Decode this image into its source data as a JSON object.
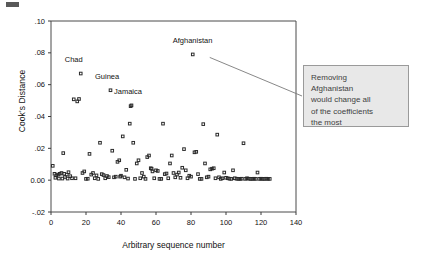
{
  "chart_data": {
    "type": "scatter",
    "title": "",
    "xlabel": "Arbitrary sequence number",
    "ylabel": "Cook's Distance",
    "xlim": [
      0,
      140
    ],
    "ylim": [
      -0.02,
      0.1
    ],
    "xticks": [
      "0",
      "20",
      "40",
      "60",
      "80",
      "100",
      "120",
      "140"
    ],
    "xtick_values": [
      0,
      20,
      40,
      60,
      80,
      100,
      120,
      140
    ],
    "yticks": [
      "-.02",
      "0.00",
      ".02",
      ".04",
      ".06",
      ".08",
      ".10"
    ],
    "ytick_values": [
      -0.02,
      0.0,
      0.02,
      0.04,
      0.06,
      0.08,
      0.1
    ],
    "grid": false,
    "legend": "none",
    "marker": "open-square",
    "marker_color": "#2a2a2a",
    "annotations": [
      {
        "text": "Chad",
        "x": 17,
        "y": 0.067,
        "label_dx": -4,
        "label_dy": 0.006
      },
      {
        "text": "Guinea",
        "x": 34,
        "y": 0.0565,
        "label_dx": -2,
        "label_dy": 0.006
      },
      {
        "text": "Jamaica",
        "x": 46,
        "y": 0.047,
        "label_dx": -2,
        "label_dy": 0.006
      },
      {
        "text": "Afghanistan",
        "x": 81,
        "y": 0.079,
        "label_dx": 0,
        "label_dy": 0.006
      }
    ],
    "points": [
      [
        1,
        0.009
      ],
      [
        2,
        0.004
      ],
      [
        2.5,
        0.0015
      ],
      [
        3,
        0.003
      ],
      [
        4,
        0.0035
      ],
      [
        4.5,
        0.001
      ],
      [
        5,
        0.004
      ],
      [
        6,
        0.0045
      ],
      [
        6.5,
        0.001
      ],
      [
        7,
        0.017
      ],
      [
        7.5,
        0.004
      ],
      [
        8,
        0.002
      ],
      [
        9,
        0.0035
      ],
      [
        9.5,
        0.001
      ],
      [
        10,
        0.005
      ],
      [
        11,
        0.0025
      ],
      [
        12,
        0.0012
      ],
      [
        13,
        0.0508
      ],
      [
        14,
        0.0012
      ],
      [
        15,
        0.0495
      ],
      [
        16,
        0.051
      ],
      [
        17,
        0.067
      ],
      [
        18,
        0.0045
      ],
      [
        19,
        0.0055
      ],
      [
        20,
        0.0008
      ],
      [
        21,
        0.0009
      ],
      [
        22,
        0.0165
      ],
      [
        23,
        0.0035
      ],
      [
        24,
        0.0045
      ],
      [
        25,
        0.0012
      ],
      [
        26,
        0.003
      ],
      [
        27,
        0.0008
      ],
      [
        28,
        0.0235
      ],
      [
        29,
        0.0038
      ],
      [
        30,
        0.0032
      ],
      [
        31,
        0.0012
      ],
      [
        32,
        0.0026
      ],
      [
        33,
        0.0019
      ],
      [
        34,
        0.0565
      ],
      [
        35,
        0.0185
      ],
      [
        36,
        0.0018
      ],
      [
        37,
        0.0022
      ],
      [
        38,
        0.0115
      ],
      [
        39,
        0.0125
      ],
      [
        39.5,
        0.0022
      ],
      [
        40,
        0.0028
      ],
      [
        41,
        0.0275
      ],
      [
        42,
        0.0018
      ],
      [
        43,
        0.0065
      ],
      [
        44,
        0.001
      ],
      [
        45,
        0.0355
      ],
      [
        45.5,
        0.0465
      ],
      [
        46,
        0.047
      ],
      [
        47,
        0.0235
      ],
      [
        48,
        0.0008
      ],
      [
        49,
        0.0105
      ],
      [
        50,
        0.0125
      ],
      [
        51,
        0.0012
      ],
      [
        52,
        0.0045
      ],
      [
        53,
        0.0022
      ],
      [
        54,
        0.0008
      ],
      [
        55,
        0.0145
      ],
      [
        56,
        0.0155
      ],
      [
        57,
        0.0075
      ],
      [
        57.5,
        0.0072
      ],
      [
        58,
        0.0055
      ],
      [
        59,
        0.0012
      ],
      [
        60,
        0.0062
      ],
      [
        61,
        0.0058
      ],
      [
        62,
        0.0008
      ],
      [
        63,
        0.0008
      ],
      [
        64,
        0.0355
      ],
      [
        65,
        0.0038
      ],
      [
        66,
        0.0042
      ],
      [
        67,
        0.0012
      ],
      [
        68,
        0.0105
      ],
      [
        69,
        0.0155
      ],
      [
        70,
        0.0045
      ],
      [
        71,
        0.0018
      ],
      [
        72,
        0.0035
      ],
      [
        73,
        0.0048
      ],
      [
        74,
        0.0015
      ],
      [
        75,
        0.0078
      ],
      [
        76,
        0.0195
      ],
      [
        77,
        0.0062
      ],
      [
        78,
        0.0012
      ],
      [
        79,
        0.0028
      ],
      [
        80,
        0.0022
      ],
      [
        81,
        0.079
      ],
      [
        82,
        0.0175
      ],
      [
        83,
        0.0178
      ],
      [
        84,
        0.0038
      ],
      [
        85,
        0.0008
      ],
      [
        86,
        0.0008
      ],
      [
        87,
        0.0352
      ],
      [
        88,
        0.0105
      ],
      [
        89,
        0.0018
      ],
      [
        90,
        0.0022
      ],
      [
        91,
        0.0068
      ],
      [
        92,
        0.0072
      ],
      [
        93,
        0.0075
      ],
      [
        94,
        0.0012
      ],
      [
        95,
        0.0286
      ],
      [
        96,
        0.0018
      ],
      [
        97,
        0.0008
      ],
      [
        98,
        0.0012
      ],
      [
        99,
        0.0048
      ],
      [
        100,
        0.0015
      ],
      [
        101,
        0.0012
      ],
      [
        102,
        0.0009
      ],
      [
        103,
        0.0008
      ],
      [
        104,
        0.0062
      ],
      [
        105,
        0.0012
      ],
      [
        106,
        0.0009
      ],
      [
        107,
        0.0008
      ],
      [
        108,
        0.0008
      ],
      [
        109,
        0.0009
      ],
      [
        110,
        0.0232
      ],
      [
        111,
        0.0008
      ],
      [
        112,
        0.0012
      ],
      [
        113,
        0.0009
      ],
      [
        114,
        0.0008
      ],
      [
        115,
        0.0008
      ],
      [
        116,
        0.0009
      ],
      [
        117,
        0.0008
      ],
      [
        118,
        0.0048
      ],
      [
        119,
        0.0008
      ],
      [
        120,
        0.0009
      ],
      [
        121,
        0.0008
      ],
      [
        122,
        0.0008
      ],
      [
        123,
        0.0009
      ],
      [
        124,
        0.0008
      ],
      [
        125,
        0.0008
      ]
    ]
  },
  "callout": {
    "lines": [
      "Removing",
      "Afghanistan",
      "would change all",
      "of the coefficients",
      "the most"
    ]
  }
}
